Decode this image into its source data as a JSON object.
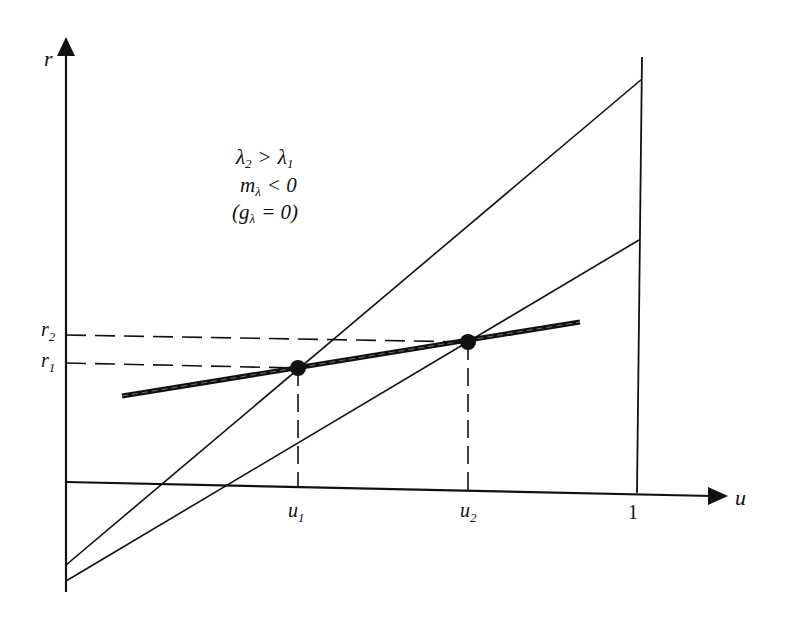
{
  "diagram": {
    "axes": {
      "y_label": "r",
      "x_label": "u",
      "x_tick_one": "1"
    },
    "annotation": {
      "line1": "λ₂ > λ₁",
      "line2": "m_λ < 0",
      "line3": "(g_λ = 0)",
      "lambda2": "λ",
      "sub2": "2",
      "gt": ">",
      "lambda1": "λ",
      "sub1": "1",
      "m": "m",
      "m_sub": "λ",
      "lt_zero": "< 0",
      "g_open": "(g",
      "g_sub": "λ",
      "g_eq": "= 0)"
    },
    "levels": {
      "r1": "r",
      "r1_sub": "1",
      "r2": "r",
      "r2_sub": "2",
      "u1": "u",
      "u1_sub": "1",
      "u2": "u",
      "u2_sub": "2"
    },
    "colors": {
      "ink": "#111111",
      "background": "#ffffff"
    }
  }
}
